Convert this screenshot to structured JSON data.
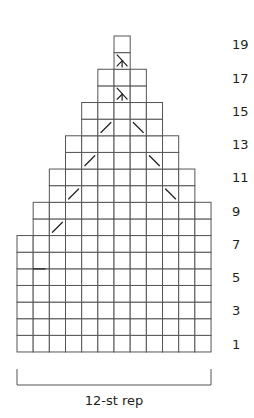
{
  "chart": {
    "type": "knitting-chart",
    "columns": 12,
    "rows": 19,
    "origin": {
      "x": 17,
      "y": 36
    },
    "cell_width": 16.17,
    "cell_height": 16.63,
    "row_extents": [
      {
        "rows": [
          1,
          7
        ],
        "first_col": 0,
        "last_col": 11
      },
      {
        "rows": [
          8,
          9
        ],
        "first_col": 1,
        "last_col": 11
      },
      {
        "rows": [
          10,
          11
        ],
        "first_col": 2,
        "last_col": 10
      },
      {
        "rows": [
          12,
          13
        ],
        "first_col": 3,
        "last_col": 9
      },
      {
        "rows": [
          14,
          15
        ],
        "first_col": 4,
        "last_col": 8
      },
      {
        "rows": [
          16,
          17
        ],
        "first_col": 5,
        "last_col": 7
      },
      {
        "rows": [
          18,
          19
        ],
        "first_col": 6,
        "last_col": 6
      }
    ],
    "symbols": [
      {
        "row": 6,
        "col": 1,
        "type": "dash"
      },
      {
        "row": 8,
        "col": 2,
        "type": "k2tog-slash"
      },
      {
        "row": 10,
        "col": 3,
        "type": "k2tog-slash"
      },
      {
        "row": 10,
        "col": 9,
        "type": "ssk-backslash"
      },
      {
        "row": 12,
        "col": 4,
        "type": "k2tog-slash"
      },
      {
        "row": 12,
        "col": 8,
        "type": "ssk-backslash"
      },
      {
        "row": 14,
        "col": 5,
        "type": "k2tog-slash"
      },
      {
        "row": 14,
        "col": 7,
        "type": "ssk-backslash"
      },
      {
        "row": 16,
        "col": 6,
        "type": "double-decrease"
      },
      {
        "row": 18,
        "col": 6,
        "type": "double-decrease"
      }
    ],
    "row_numbers": [
      "1",
      "3",
      "5",
      "7",
      "9",
      "11",
      "13",
      "15",
      "17",
      "19"
    ],
    "repeat_label": "12-st rep"
  },
  "colors": {
    "grid": "#555555",
    "ink": "#231f20",
    "background": "#ffffff"
  }
}
